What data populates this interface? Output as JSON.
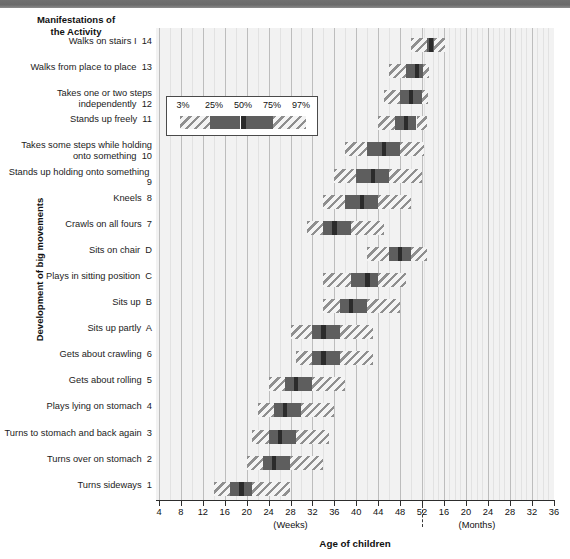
{
  "header": {
    "column_header_line1": "Manifestations of",
    "column_header_line2": "the Activity"
  },
  "axes": {
    "y_title": "Development of big movements",
    "x_title": "Age of children",
    "x_unit_weeks": "(Weeks)",
    "x_unit_months": "(Months)",
    "week_ticks": [
      4,
      8,
      12,
      16,
      20,
      24,
      28,
      32,
      36,
      40,
      44,
      48,
      52
    ],
    "month_ticks": [
      16,
      20,
      24,
      28,
      32,
      36
    ],
    "reference_line_label": "52"
  },
  "legend": {
    "percentiles": [
      "3%",
      "25%",
      "50%",
      "75%",
      "97%"
    ]
  },
  "chart_data": {
    "type": "bar",
    "title": "Development of big movements",
    "xlabel": "Age of children",
    "ylabel": "Manifestations of the Activity",
    "x_unit_note": "Weeks from 4 to 52, then Months from 16 to 36",
    "grid": true,
    "legend_position": "inside-upper-left",
    "percentile_levels": [
      3,
      25,
      50,
      75,
      97
    ],
    "reference_line": {
      "value": 52,
      "unit": "weeks",
      "style": "dashed"
    },
    "categories": [
      {
        "code": "14",
        "label": "Walks on stairs I"
      },
      {
        "code": "13",
        "label": "Walks from place to place"
      },
      {
        "code": "12",
        "label": "Takes one or two steps independently"
      },
      {
        "code": "11",
        "label": "Stands up freely"
      },
      {
        "code": "10",
        "label": "Takes some steps while holding onto something"
      },
      {
        "code": "9",
        "label": "Stands up holding onto something"
      },
      {
        "code": "8",
        "label": "Kneels"
      },
      {
        "code": "7",
        "label": "Crawls on all fours"
      },
      {
        "code": "D",
        "label": "Sits on chair"
      },
      {
        "code": "C",
        "label": "Plays in sitting position"
      },
      {
        "code": "B",
        "label": "Sits up"
      },
      {
        "code": "A",
        "label": "Sits up partly"
      },
      {
        "code": "6",
        "label": "Gets about crawling"
      },
      {
        "code": "5",
        "label": "Gets about rolling"
      },
      {
        "code": "4",
        "label": "Plays lying on stomach"
      },
      {
        "code": "3",
        "label": "Turns to stomach and back again"
      },
      {
        "code": "2",
        "label": "Turns over on stomach"
      },
      {
        "code": "1",
        "label": "Turns sideways"
      }
    ],
    "series": [
      {
        "name": "p3",
        "values": [
          50,
          46,
          45,
          44,
          38,
          36,
          34,
          31,
          42,
          34,
          34,
          28,
          29,
          24,
          22,
          21,
          20,
          14
        ]
      },
      {
        "name": "p25",
        "values": [
          56,
          49,
          48,
          47,
          42,
          40,
          38,
          34,
          46,
          39,
          37,
          32,
          32,
          27,
          25,
          24,
          23,
          17
        ]
      },
      {
        "name": "p50",
        "values": [
          59,
          51,
          50,
          49,
          45,
          43,
          41,
          36,
          48,
          42,
          39,
          34,
          34,
          29,
          27,
          26,
          25,
          19
        ]
      },
      {
        "name": "p75",
        "values": [
          62,
          53,
          52,
          51,
          48,
          46,
          44,
          39,
          50,
          44,
          42,
          37,
          37,
          32,
          30,
          29,
          28,
          21
        ]
      },
      {
        "name": "p97",
        "values": [
          70,
          58,
          57,
          56,
          54,
          52,
          50,
          45,
          56,
          49,
          48,
          43,
          43,
          38,
          36,
          35,
          34,
          28
        ]
      }
    ],
    "x_scale_note": "Values expressed in weeks; weeks beyond 52 map onto the month portion of the axis."
  }
}
